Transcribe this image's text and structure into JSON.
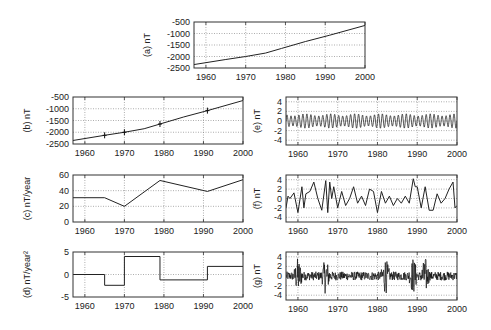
{
  "chart_data": [
    {
      "id": "a",
      "type": "line",
      "ylabel": "(a) nT",
      "xlabel": "",
      "xlim": [
        1957,
        2000
      ],
      "ylim": [
        -2500,
        -500
      ],
      "xticks": [
        1960,
        1970,
        1980,
        1990,
        2000
      ],
      "yticks": [
        -500,
        -1000,
        -1500,
        -2000,
        -2500
      ],
      "grid": true,
      "series": [
        {
          "name": "field",
          "x": [
            1957,
            1965,
            1970,
            1975,
            1979,
            1985,
            1991,
            2000
          ],
          "y": [
            -2350,
            -2130,
            -2000,
            -1850,
            -1650,
            -1350,
            -1080,
            -650
          ]
        }
      ]
    },
    {
      "id": "b",
      "type": "line",
      "ylabel": "(b) nT",
      "xlabel": "",
      "xlim": [
        1957,
        2000
      ],
      "ylim": [
        -2500,
        -500
      ],
      "xticks": [
        1960,
        1970,
        1980,
        1990,
        2000
      ],
      "yticks": [
        -500,
        -1000,
        -1500,
        -2000,
        -2500
      ],
      "grid": true,
      "markers_x": [
        1965,
        1970,
        1979,
        1991
      ],
      "series": [
        {
          "name": "fit",
          "x": [
            1957,
            1965,
            1970,
            1975,
            1979,
            1985,
            1991,
            2000
          ],
          "y": [
            -2350,
            -2130,
            -2000,
            -1850,
            -1650,
            -1350,
            -1080,
            -650
          ]
        }
      ]
    },
    {
      "id": "c",
      "type": "line",
      "ylabel": "(c) nT/year",
      "xlabel": "",
      "xlim": [
        1957,
        2000
      ],
      "ylim": [
        0,
        60
      ],
      "xticks": [
        1960,
        1970,
        1980,
        1990,
        2000
      ],
      "yticks": [
        0,
        20,
        40,
        60
      ],
      "grid": true,
      "series": [
        {
          "name": "secular variation",
          "x": [
            1957,
            1965,
            1970,
            1979,
            1991,
            2000
          ],
          "y": [
            31,
            31,
            20,
            53,
            39,
            54
          ]
        }
      ]
    },
    {
      "id": "d",
      "type": "line",
      "ylabel": "(d) nT/year²",
      "xlabel": "",
      "xlim": [
        1957,
        2000
      ],
      "ylim": [
        -5,
        5
      ],
      "xticks": [
        1960,
        1970,
        1980,
        1990,
        2000
      ],
      "yticks": [
        -5,
        0,
        5
      ],
      "grid": true,
      "step": true,
      "series": [
        {
          "name": "secular acceleration",
          "x": [
            1957,
            1965,
            1965,
            1970,
            1970,
            1979,
            1979,
            1991,
            1991,
            2000
          ],
          "y": [
            0,
            0,
            -2.4,
            -2.4,
            4,
            4,
            -1.2,
            -1.2,
            1.8,
            1.8
          ]
        }
      ]
    },
    {
      "id": "e",
      "type": "line",
      "ylabel": "(e) nT",
      "xlabel": "",
      "xlim": [
        1957,
        2000
      ],
      "ylim": [
        -5,
        5
      ],
      "xticks": [
        1960,
        1970,
        1980,
        1990,
        2000
      ],
      "yticks": [
        -4,
        -2,
        0,
        2,
        4
      ],
      "grid": true,
      "series": [
        {
          "name": "annual oscillation",
          "description": "periodic signal, ~1 cycle/year, amplitude ~1.5 nT",
          "amplitude": 1.5,
          "period_years": 1.0
        }
      ]
    },
    {
      "id": "f",
      "type": "line",
      "ylabel": "(f) nT",
      "xlabel": "",
      "xlim": [
        1957,
        2000
      ],
      "ylim": [
        -5,
        5
      ],
      "xticks": [
        1960,
        1970,
        1980,
        1990,
        2000
      ],
      "yticks": [
        -4,
        -2,
        0,
        2,
        4
      ],
      "grid": true,
      "series": [
        {
          "name": "residual (smoothed)",
          "x": [
            1957,
            1957.5,
            1958,
            1959,
            1960,
            1961,
            1961.5,
            1962,
            1963,
            1964,
            1965,
            1966,
            1967,
            1967.5,
            1968,
            1968.5,
            1969,
            1970,
            1971,
            1972,
            1973,
            1974,
            1975,
            1976,
            1977,
            1978,
            1979,
            1980,
            1981,
            1982,
            1983,
            1984,
            1985,
            1986,
            1987,
            1988,
            1989,
            1989.5,
            1990,
            1991,
            1992,
            1993,
            1994,
            1995,
            1996,
            1997,
            1998,
            1999,
            1999.5,
            2000
          ],
          "y": [
            -2,
            0.5,
            0,
            1.2,
            -3,
            2.5,
            -2,
            1,
            1.5,
            3.5,
            0,
            -2.5,
            3.8,
            -3,
            3.5,
            0,
            2.5,
            -2,
            1.5,
            -1.5,
            0,
            2.5,
            -1,
            0.5,
            -1.5,
            2,
            1.5,
            -3,
            1.5,
            -1,
            0.5,
            -1.5,
            0,
            -1,
            0.5,
            -1,
            4.2,
            2.5,
            2.5,
            -2,
            2.5,
            -2.5,
            -2.5,
            1,
            -1,
            0,
            2,
            3.5,
            -2,
            -1.5
          ]
        }
      ]
    },
    {
      "id": "g",
      "type": "line",
      "ylabel": "(g) nT",
      "xlabel": "",
      "xlim": [
        1957,
        2000
      ],
      "ylim": [
        -5,
        5
      ],
      "xticks": [
        1960,
        1970,
        1980,
        1990,
        2000
      ],
      "yticks": [
        -4,
        -2,
        0,
        2,
        4
      ],
      "grid": true,
      "series": [
        {
          "name": "residual (high-frequency)",
          "description": "dense noise centered on 0, bursts to ±5 near 1960, 1967, 1982, 1992",
          "bursts_x": [
            1960,
            1967,
            1982,
            1989,
            1992
          ]
        }
      ]
    }
  ]
}
